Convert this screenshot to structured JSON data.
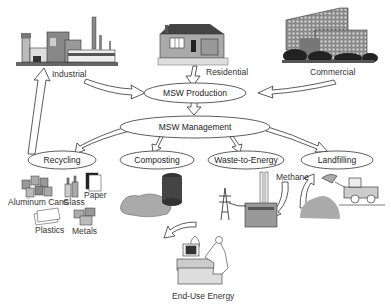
{
  "diagram": {
    "sources": [
      {
        "id": "industrial",
        "label": "Industrial"
      },
      {
        "id": "residential",
        "label": "Residential"
      },
      {
        "id": "commercial",
        "label": "Commercial"
      }
    ],
    "nodes": {
      "production": {
        "label": "MSW Production"
      },
      "management": {
        "label": "MSW Management"
      },
      "recycling": {
        "label": "Recycling"
      },
      "composting": {
        "label": "Composting"
      },
      "wte": {
        "label": "Waste-to-Energy"
      },
      "landfilling": {
        "label": "Landfilling"
      }
    },
    "recycling_items": [
      {
        "id": "aluminum",
        "label": "Aluminum Cans"
      },
      {
        "id": "glass",
        "label": "Glass"
      },
      {
        "id": "paper",
        "label": "Paper"
      },
      {
        "id": "plastics",
        "label": "Plastics"
      },
      {
        "id": "metals",
        "label": "Metals"
      }
    ],
    "methane_label": "Methane",
    "end_use_label": "End-Use Energy",
    "edges": [
      {
        "from": "industrial",
        "to": "production"
      },
      {
        "from": "residential",
        "to": "production"
      },
      {
        "from": "commercial",
        "to": "production"
      },
      {
        "from": "production",
        "to": "management"
      },
      {
        "from": "management",
        "to": "recycling"
      },
      {
        "from": "management",
        "to": "composting"
      },
      {
        "from": "management",
        "to": "wte"
      },
      {
        "from": "management",
        "to": "landfilling"
      },
      {
        "from": "recycling",
        "to": "industrial"
      },
      {
        "from": "landfill",
        "to": "methane"
      },
      {
        "from": "methane",
        "to": "wte-plant"
      },
      {
        "from": "wte-plant",
        "to": "end-use"
      }
    ]
  }
}
